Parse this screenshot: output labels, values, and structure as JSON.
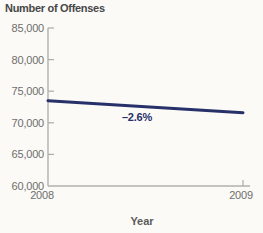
{
  "title": "Number of Offenses",
  "annotation": "–2.6%",
  "colors": {
    "line": "#273069",
    "axis": "#b2b0ad",
    "tick_label": "#6f6e6c",
    "title_text": "#474747",
    "annotation_text": "#273069",
    "background": "#fbfaf7"
  },
  "chart_data": {
    "type": "line",
    "title": "Number of Offenses",
    "xlabel": "Year",
    "ylabel": "Number of Offenses",
    "x": [
      2008,
      2009
    ],
    "series": [
      {
        "name": "Number of Offenses",
        "values": [
          73500,
          71600
        ]
      }
    ],
    "percent_change_label": "–2.6%",
    "ylim": [
      60000,
      85000
    ],
    "ytick_interval": 5000,
    "yticks": [
      "85,000",
      "80,000",
      "75,000",
      "70,000",
      "65,000",
      "60,000"
    ],
    "xticks": [
      "2008",
      "2009"
    ],
    "grid": false,
    "legend": "none",
    "line_color": "#273069",
    "annotations": [
      {
        "text": "–2.6%",
        "anchor_x": 2008.45,
        "anchor_y": 71400
      }
    ]
  }
}
